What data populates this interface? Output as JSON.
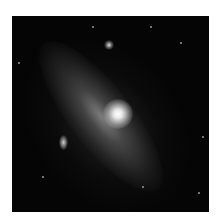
{
  "image": {
    "subject": "spiral galaxy",
    "palette": {
      "background": "#ffffff",
      "sky": "#050505",
      "core": "#ffffff",
      "disk": "#8a8a8a"
    },
    "stars": [
      {
        "x": 80,
        "y": 10
      },
      {
        "x": 138,
        "y": 10
      },
      {
        "x": 168,
        "y": 26
      },
      {
        "x": 6,
        "y": 46
      },
      {
        "x": 190,
        "y": 120
      },
      {
        "x": 186,
        "y": 176
      },
      {
        "x": 130,
        "y": 170
      },
      {
        "x": 30,
        "y": 160
      }
    ]
  }
}
